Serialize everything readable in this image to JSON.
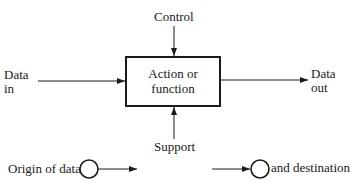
{
  "diagram": {
    "type": "process-block",
    "box": {
      "label_line1": "Action or",
      "label_line2": "function"
    },
    "inputs": {
      "control": "Control",
      "support": "Support",
      "data_in_line1": "Data",
      "data_in_line2": "in",
      "data_out_line1": "Data",
      "data_out_line2": "out"
    },
    "legend": {
      "origin": "Origin of data",
      "destination": "and destination"
    },
    "colors": {
      "stroke": "#1a1a1a",
      "background": "#ffffff"
    }
  }
}
